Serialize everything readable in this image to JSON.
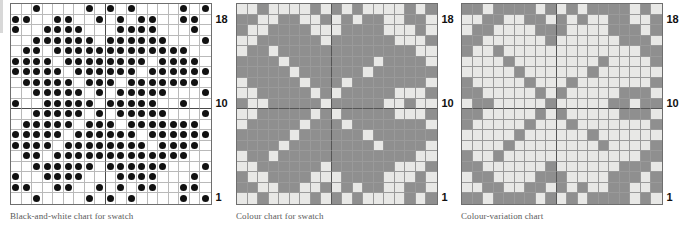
{
  "page": {
    "background_color": "#ffffff"
  },
  "palette": {
    "dot_color": "#111111",
    "white_cell": "#ffffff",
    "light_cell": "#e8e8e6",
    "mid_grey_cell": "#8f8f8f",
    "grid_line": "#b9b9b9",
    "heavy_grid_line": "#4a4a4a",
    "border": "#6e6e6e",
    "caption_color": "#5a5a5a",
    "label_color": "#111111"
  },
  "charts": [
    {
      "id": "black-and-white-chart",
      "caption": "Black-and-white chart for swatch",
      "type": "knitting-chart",
      "style": "dots",
      "columns": 19,
      "rows": 19,
      "row_labels": [
        {
          "row": 18,
          "label": "18"
        },
        {
          "row": 10,
          "label": "10"
        },
        {
          "row": 1,
          "label": "1"
        }
      ],
      "heavy_gridlines": {
        "columns": [
          9
        ],
        "rows": [
          10
        ]
      },
      "legend": {
        "dot": "contrast colour stitch",
        "blank": "background colour stitch"
      }
    },
    {
      "id": "colour-chart",
      "caption": "Colour chart for swatch",
      "type": "knitting-chart",
      "style": "filled",
      "columns": 19,
      "rows": 19,
      "colors": {
        "1": "#8f8f8f",
        "0": "#e8e8e6"
      },
      "row_labels": [
        {
          "row": 18,
          "label": "18"
        },
        {
          "row": 10,
          "label": "10"
        },
        {
          "row": 1,
          "label": "1"
        }
      ],
      "heavy_gridlines": {
        "columns": [
          9
        ],
        "rows": [
          10
        ]
      }
    },
    {
      "id": "colour-variation-chart",
      "caption": "Colour-variation chart",
      "type": "knitting-chart",
      "style": "filled-inverted",
      "columns": 19,
      "rows": 19,
      "colors": {
        "1": "#e8e8e6",
        "0": "#8f8f8f"
      },
      "row_labels": [
        {
          "row": 18,
          "label": "18"
        },
        {
          "row": 10,
          "label": "10"
        },
        {
          "row": 1,
          "label": "1"
        }
      ],
      "heavy_gridlines": {
        "columns": [
          9
        ],
        "rows": [
          10
        ]
      }
    }
  ],
  "chart_data": {
    "type": "heatmap",
    "xlabel": "",
    "ylabel": "Row",
    "grid": [
      [
        0,
        0,
        1,
        0,
        0,
        0,
        0,
        1,
        0,
        1,
        0,
        1,
        0,
        0,
        0,
        0,
        1,
        0,
        1
      ],
      [
        1,
        1,
        0,
        0,
        1,
        1,
        0,
        0,
        1,
        0,
        1,
        0,
        1,
        1,
        0,
        0,
        1,
        1,
        0
      ],
      [
        1,
        0,
        0,
        1,
        1,
        1,
        1,
        0,
        0,
        0,
        1,
        1,
        1,
        1,
        0,
        0,
        0,
        1,
        0
      ],
      [
        0,
        0,
        1,
        1,
        1,
        1,
        1,
        1,
        0,
        1,
        1,
        1,
        1,
        1,
        1,
        0,
        0,
        0,
        1
      ],
      [
        0,
        1,
        1,
        0,
        1,
        1,
        1,
        1,
        1,
        1,
        1,
        1,
        1,
        1,
        1,
        1,
        1,
        0,
        0
      ],
      [
        1,
        1,
        1,
        1,
        0,
        1,
        1,
        1,
        1,
        1,
        1,
        1,
        1,
        0,
        1,
        1,
        1,
        1,
        0
      ],
      [
        1,
        1,
        1,
        1,
        1,
        0,
        1,
        1,
        1,
        1,
        1,
        1,
        0,
        1,
        1,
        1,
        1,
        1,
        1
      ],
      [
        0,
        1,
        1,
        1,
        1,
        1,
        0,
        1,
        1,
        1,
        0,
        1,
        1,
        1,
        1,
        1,
        1,
        1,
        0
      ],
      [
        0,
        0,
        1,
        1,
        1,
        1,
        1,
        0,
        1,
        0,
        1,
        1,
        1,
        1,
        1,
        0,
        0,
        0,
        1
      ],
      [
        1,
        0,
        0,
        1,
        1,
        1,
        1,
        1,
        0,
        1,
        1,
        1,
        1,
        1,
        0,
        0,
        1,
        0,
        0
      ],
      [
        0,
        0,
        1,
        1,
        1,
        1,
        1,
        0,
        1,
        0,
        1,
        1,
        1,
        1,
        1,
        0,
        0,
        0,
        1
      ],
      [
        0,
        1,
        1,
        1,
        1,
        1,
        0,
        1,
        1,
        1,
        0,
        1,
        1,
        1,
        1,
        1,
        1,
        1,
        0
      ],
      [
        1,
        1,
        1,
        1,
        1,
        0,
        1,
        1,
        1,
        1,
        1,
        1,
        0,
        1,
        1,
        1,
        1,
        1,
        1
      ],
      [
        1,
        1,
        1,
        1,
        0,
        1,
        1,
        1,
        1,
        1,
        1,
        1,
        1,
        0,
        1,
        1,
        1,
        1,
        0
      ],
      [
        0,
        1,
        1,
        0,
        1,
        1,
        1,
        1,
        1,
        1,
        1,
        1,
        1,
        1,
        1,
        1,
        1,
        0,
        0
      ],
      [
        0,
        0,
        1,
        1,
        1,
        1,
        1,
        1,
        0,
        1,
        1,
        1,
        1,
        1,
        1,
        0,
        0,
        0,
        1
      ],
      [
        1,
        0,
        0,
        1,
        1,
        1,
        1,
        0,
        0,
        0,
        1,
        1,
        1,
        1,
        0,
        0,
        0,
        1,
        0
      ],
      [
        1,
        1,
        0,
        0,
        1,
        1,
        0,
        0,
        1,
        0,
        1,
        0,
        1,
        1,
        0,
        0,
        1,
        1,
        0
      ],
      [
        0,
        0,
        1,
        0,
        0,
        0,
        0,
        1,
        0,
        1,
        0,
        1,
        0,
        0,
        0,
        0,
        1,
        0,
        1
      ]
    ],
    "legend": "",
    "columns": 19,
    "rows": 19,
    "row_tick_labels": [
      "18",
      "10",
      "1"
    ],
    "row_tick_rows": [
      18,
      10,
      1
    ],
    "note": "grid[0] is the TOP row (row 19); grid[18] is the BOTTOM row (row 1). 1 = marked/dot/grey stitch, 0 = blank/light stitch."
  },
  "layout": {
    "charts_left": [
      10,
      236,
      461
    ],
    "chart_top": 3,
    "cell_size": 10.5,
    "caption_top": 211
  }
}
